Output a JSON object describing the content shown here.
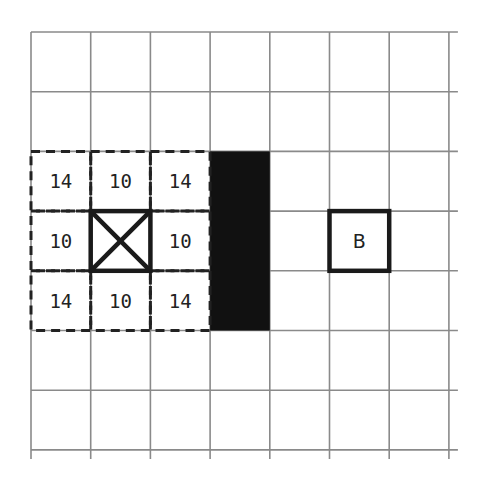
{
  "grid": {
    "cols": 7,
    "rows": 7,
    "origin_x": 31,
    "origin_y": 32,
    "cell_size": 59.7,
    "line_color": "#8a8a8a",
    "overhang": 9
  },
  "wall": {
    "col": 3,
    "row_start": 2,
    "row_end": 5,
    "color": "#111111"
  },
  "agent": {
    "col": 1,
    "row": 3,
    "marker": "x-box"
  },
  "goal": {
    "col": 5,
    "row": 3,
    "label": "B"
  },
  "neighbors": [
    {
      "col": 0,
      "row": 2,
      "value": "14"
    },
    {
      "col": 1,
      "row": 2,
      "value": "10"
    },
    {
      "col": 2,
      "row": 2,
      "value": "14"
    },
    {
      "col": 0,
      "row": 3,
      "value": "10"
    },
    {
      "col": 2,
      "row": 3,
      "value": "10"
    },
    {
      "col": 0,
      "row": 4,
      "value": "14"
    },
    {
      "col": 1,
      "row": 4,
      "value": "10"
    },
    {
      "col": 2,
      "row": 4,
      "value": "14"
    }
  ]
}
